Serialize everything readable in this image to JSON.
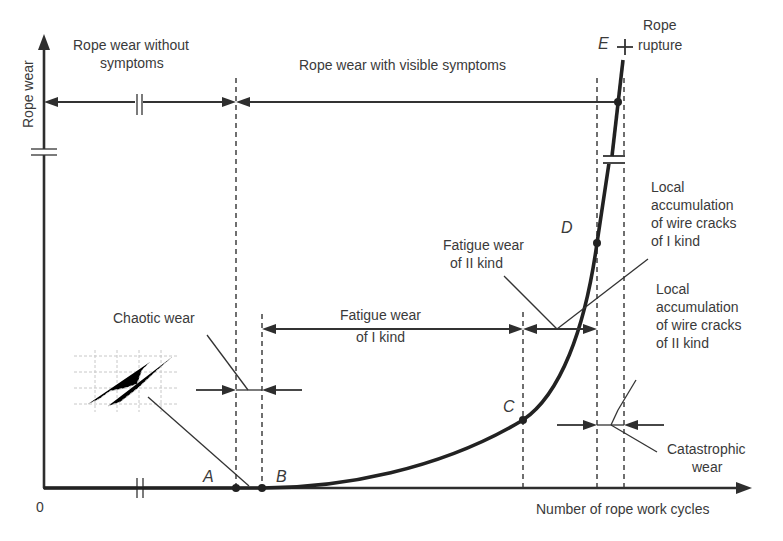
{
  "axes": {
    "y_label": "Rope wear",
    "x_label": "Number of rope work cycles",
    "origin": "0"
  },
  "regions": {
    "without_symptoms": [
      "Rope wear without",
      "symptoms"
    ],
    "visible_symptoms": "Rope wear with visible symptoms",
    "rope_rupture": [
      "Rope",
      "rupture"
    ]
  },
  "points": {
    "A": "A",
    "B": "B",
    "C": "C",
    "D": "D",
    "E": "E"
  },
  "annotations": {
    "chaotic_wear": "Chaotic wear",
    "fatigue_I": [
      "Fatigue wear",
      "of I kind"
    ],
    "fatigue_II": [
      "Fatigue wear",
      "of II kind"
    ],
    "local_cracks_I": [
      "Local",
      "accumulation",
      "of wire cracks",
      "of I kind"
    ],
    "local_cracks_II": [
      "Local",
      "accumulation",
      "of wire cracks",
      "of II kind"
    ],
    "catastrophic": [
      "Catastrophic",
      "wear"
    ]
  },
  "colors": {
    "line": "#2e2e2e",
    "text": "#3a3a3a",
    "background": "#ffffff"
  }
}
